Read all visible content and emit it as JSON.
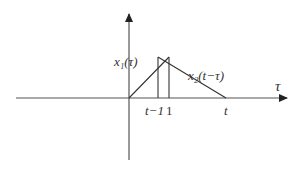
{
  "diagram": {
    "axis": {
      "horizontal_label": "τ",
      "origin_px": [
        129,
        98
      ]
    },
    "curves": [
      {
        "name": "x1",
        "label": "x₁(τ)"
      },
      {
        "name": "x2",
        "label": "x₂(t−τ)"
      }
    ],
    "ticks": [
      {
        "label": "t−1",
        "px": 158
      },
      {
        "label": "1",
        "px": 169
      },
      {
        "label": "t",
        "px": 226
      }
    ],
    "colors": {
      "stroke": "#333333",
      "background": "#ffffff"
    }
  }
}
